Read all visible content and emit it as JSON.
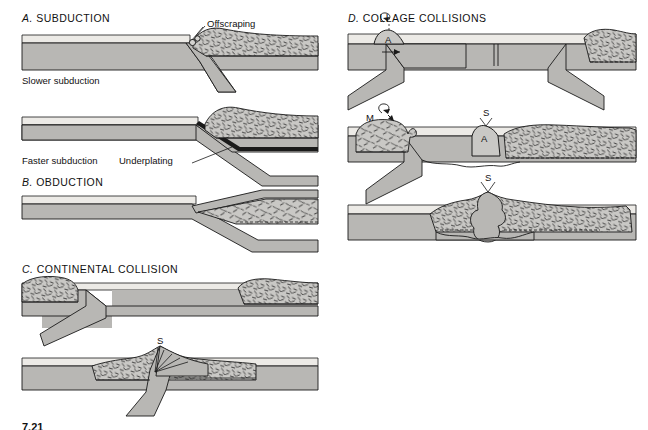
{
  "figure": {
    "caption": "7.21",
    "colors": {
      "ocean_layer": "#eceae6",
      "lithosphere_fill": "#b8b7b4",
      "continental_crust_fill": "#c9c8c5",
      "outline": "#1a1a1a",
      "background": "#ffffff",
      "stipple": "#2a2a2a"
    }
  },
  "panels": {
    "a": {
      "letter": "A.",
      "title": "SUBDUCTION",
      "labels": {
        "offscraping": "Offscraping",
        "slower": "Slower subduction",
        "faster": "Faster subduction",
        "underplating": "Underplating"
      }
    },
    "b": {
      "letter": "B.",
      "title": "OBDUCTION"
    },
    "c": {
      "letter": "C.",
      "title": "CONTINENTAL COLLISION",
      "marks": {
        "suture": "S"
      }
    },
    "d": {
      "letter": "D.",
      "title": "COLLAGE COLLISIONS",
      "marks": {
        "arc_top": "A",
        "microcontinent": "M",
        "suture_middle": "S",
        "arc_middle": "A",
        "suture_bottom": "S"
      }
    }
  }
}
